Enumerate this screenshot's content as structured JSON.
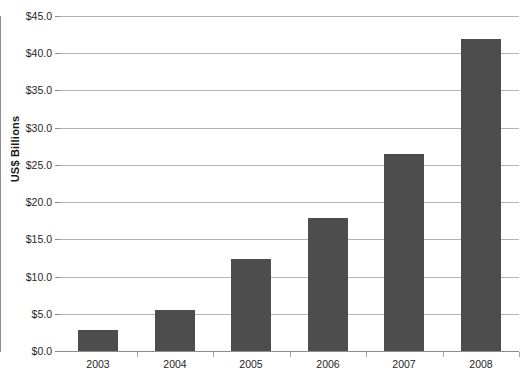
{
  "chart_data": {
    "type": "bar",
    "title": "",
    "subtitle": "",
    "xlabel": "",
    "ylabel": "US$ Billions",
    "categories": [
      "2003",
      "2004",
      "2005",
      "2006",
      "2007",
      "2008"
    ],
    "values": [
      2.8,
      5.5,
      12.3,
      17.8,
      26.5,
      41.9
    ],
    "ylim": [
      0.0,
      45.0
    ],
    "ytick_step": 5.0,
    "ytick_labels": [
      "$0.0",
      "$5.0",
      "$10.0",
      "$15.0",
      "$20.0",
      "$25.0",
      "$30.0",
      "$35.0",
      "$40.0",
      "$45.0"
    ],
    "ytick_values": [
      0.0,
      5.0,
      10.0,
      15.0,
      20.0,
      25.0,
      30.0,
      35.0,
      40.0,
      45.0
    ],
    "grid": true,
    "grid_axis": "y",
    "legend": false,
    "legend_position": "none",
    "bar_color": "#4d4d4d",
    "gridline_color": "#9a9a9a",
    "axis_color": "#8d8d8d",
    "text_color": "#262626",
    "background_color": "#ffffff",
    "series": [
      {
        "name": "US$ Billions",
        "values": [
          2.8,
          5.5,
          12.3,
          17.8,
          26.5,
          41.9
        ]
      }
    ]
  }
}
